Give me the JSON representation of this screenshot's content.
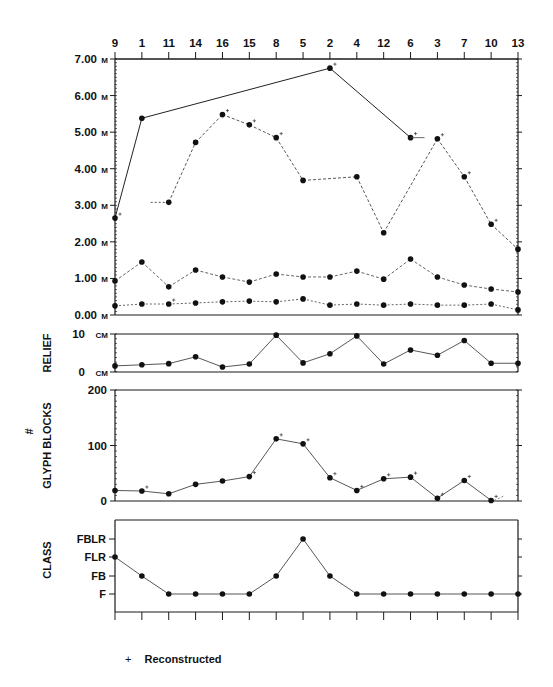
{
  "chart_data": [
    {
      "type": "line",
      "title": "",
      "xlabel": "",
      "ylabel": "",
      "categories": [
        "9",
        "1",
        "11",
        "14",
        "16",
        "15",
        "8",
        "5",
        "2",
        "4",
        "12",
        "6",
        "3",
        "7",
        "10",
        "13"
      ],
      "y_ticks": [
        "7.00 M",
        "6.00 M",
        "5.00 M",
        "4.00 M",
        "3.00 M",
        "2.00 M",
        "1.00 M",
        "0.00 M"
      ],
      "ylim": [
        0,
        7
      ],
      "series": [
        {
          "name": "series-solid",
          "style": "solid",
          "values": [
            2.65,
            5.38,
            null,
            null,
            null,
            null,
            null,
            null,
            6.75,
            null,
            null,
            4.85,
            null,
            null,
            null,
            null
          ]
        },
        {
          "name": "series-dashed-upper",
          "style": "dashed",
          "values": [
            null,
            null,
            3.08,
            4.72,
            5.48,
            5.2,
            4.85,
            3.68,
            null,
            3.78,
            2.25,
            null,
            4.82,
            3.78,
            2.48,
            1.8
          ]
        },
        {
          "name": "series-dashed-middle",
          "style": "dashed",
          "values": [
            0.93,
            1.45,
            0.77,
            1.23,
            1.04,
            0.9,
            1.12,
            1.04,
            1.04,
            1.2,
            0.98,
            1.53,
            1.04,
            0.82,
            0.71,
            0.63
          ]
        },
        {
          "name": "series-dashed-lower",
          "style": "dashed",
          "values": [
            0.25,
            0.3,
            0.3,
            0.33,
            0.36,
            0.38,
            0.36,
            0.44,
            0.27,
            0.3,
            0.27,
            0.3,
            0.27,
            0.27,
            0.3,
            0.14
          ]
        }
      ]
    },
    {
      "type": "line",
      "ylabel": "RELIEF",
      "categories": [
        "9",
        "1",
        "11",
        "14",
        "16",
        "15",
        "8",
        "5",
        "2",
        "4",
        "12",
        "6",
        "3",
        "7",
        "10",
        "13"
      ],
      "y_ticks": [
        "10 CM",
        "0 CM"
      ],
      "ylim": [
        0,
        10
      ],
      "series": [
        {
          "name": "relief",
          "values": [
            1.6,
            1.9,
            2.2,
            4.0,
            1.3,
            2.1,
            9.7,
            2.4,
            4.8,
            9.5,
            2.1,
            5.8,
            4.4,
            8.3,
            2.3,
            2.3
          ]
        }
      ]
    },
    {
      "type": "line",
      "ylabel": "# GLYPH BLOCKS",
      "categories": [
        "9",
        "1",
        "11",
        "14",
        "16",
        "15",
        "8",
        "5",
        "2",
        "4",
        "12",
        "6",
        "3",
        "7",
        "10",
        "13"
      ],
      "y_ticks": [
        "200",
        "100",
        "0"
      ],
      "ylim": [
        0,
        200
      ],
      "series": [
        {
          "name": "glyph-blocks",
          "values": [
            19,
            18,
            13,
            30,
            36,
            44,
            112,
            103,
            42,
            19,
            40,
            43,
            5,
            37,
            1,
            null
          ]
        }
      ]
    },
    {
      "type": "line",
      "ylabel": "CLASS",
      "categories": [
        "9",
        "1",
        "11",
        "14",
        "16",
        "15",
        "8",
        "5",
        "2",
        "4",
        "12",
        "6",
        "3",
        "7",
        "10",
        "13"
      ],
      "y_ticks": [
        "FBLR",
        "FLR",
        "FB",
        "F"
      ],
      "series": [
        {
          "name": "class",
          "values": [
            "FLR",
            "FB",
            "F",
            "F",
            "F",
            "F",
            "FB",
            "FBLR",
            "FB",
            "F",
            "F",
            "F",
            "F",
            "F",
            "F",
            "F"
          ]
        }
      ]
    }
  ],
  "legend": {
    "symbol": "+",
    "label": "Reconstructed"
  }
}
